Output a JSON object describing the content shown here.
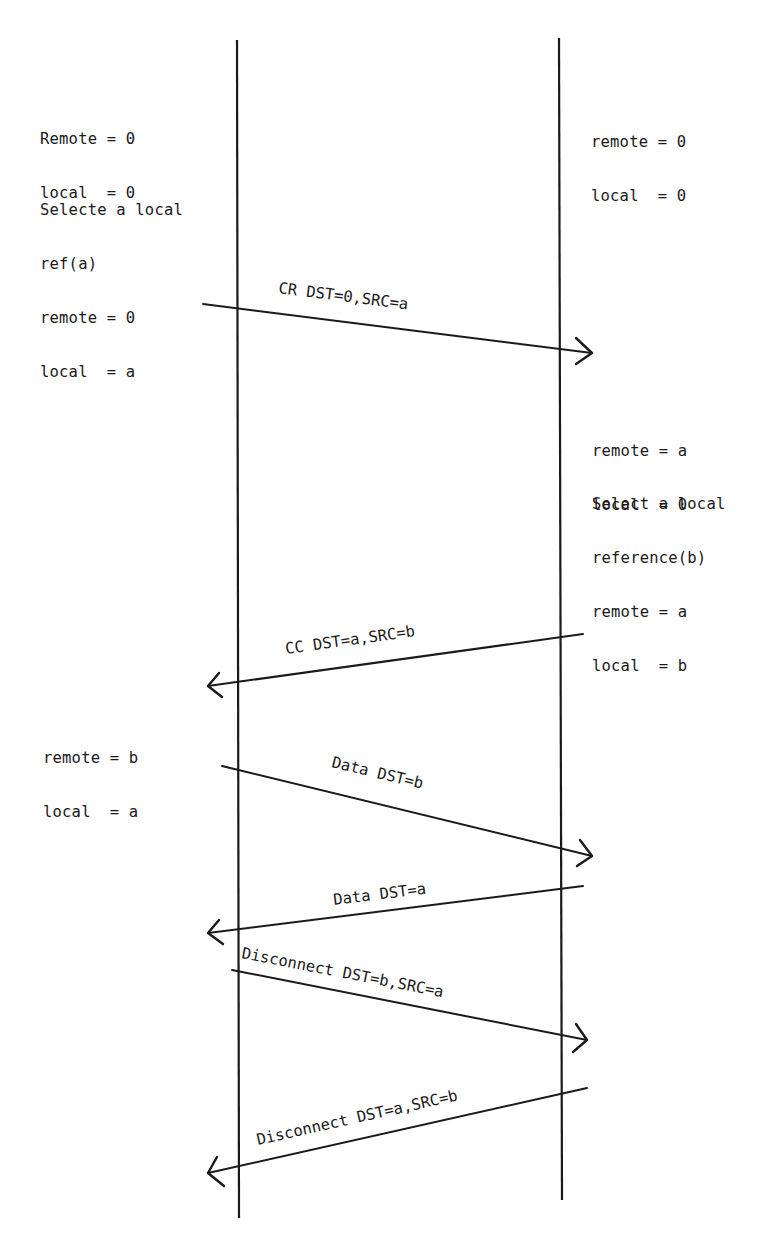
{
  "diagram": {
    "type": "sequence",
    "lifelines": [
      {
        "id": "left",
        "x": 237,
        "y_top": 40,
        "y_bottom": 1218
      },
      {
        "id": "right",
        "x": 560,
        "y_top": 40,
        "y_bottom": 1200
      }
    ],
    "notes": {
      "left_initial": {
        "lines": [
          "Remote = 0",
          "local  = 0"
        ]
      },
      "left_select": {
        "lines": [
          "Selecte a local",
          "ref(a)",
          "remote = 0",
          "local  = a"
        ]
      },
      "right_initial": {
        "lines": [
          "remote = 0",
          "local  = 0"
        ]
      },
      "right_after_cr": {
        "lines": [
          "remote = a",
          "local  = 0"
        ]
      },
      "right_select": {
        "lines": [
          "Select a local",
          "reference(b)",
          "remote = a",
          "local  = b"
        ]
      },
      "left_after_cc": {
        "lines": [
          "remote = b",
          "local  = a"
        ]
      }
    },
    "messages": [
      {
        "label": "CR DST=0,SRC=a",
        "direction": "left-to-right",
        "x1": 203,
        "y1": 304,
        "x2": 592,
        "y2": 353
      },
      {
        "label": "CC DST=a,SRC=b",
        "direction": "right-to-left",
        "x1": 583,
        "y1": 634,
        "x2": 208,
        "y2": 686
      },
      {
        "label": "Data DST=b",
        "direction": "left-to-right",
        "x1": 222,
        "y1": 766,
        "x2": 592,
        "y2": 856
      },
      {
        "label": "Data DST=a",
        "direction": "right-to-left",
        "x1": 583,
        "y1": 886,
        "x2": 208,
        "y2": 933
      },
      {
        "label": "Disconnect DST=b,SRC=a",
        "direction": "left-to-right",
        "x1": 232,
        "y1": 970,
        "x2": 587,
        "y2": 1040
      },
      {
        "label": "Disconnect DST=a,SRC=b",
        "direction": "right-to-left",
        "x1": 587,
        "y1": 1088,
        "x2": 208,
        "y2": 1173
      }
    ]
  }
}
